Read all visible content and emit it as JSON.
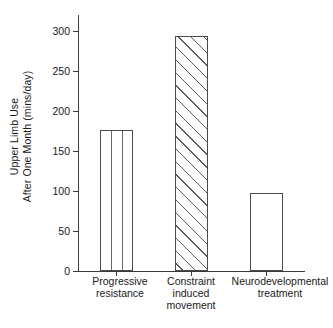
{
  "chart_data": {
    "type": "bar",
    "title": "",
    "subtitle": "",
    "xlabel": "",
    "ylabel": "Upper Limb Use After One Month (mins/day)",
    "ylabel_lines": [
      "Upper Limb Use",
      "After One Month (mins/day)"
    ],
    "categories": [
      "Progressive resistance",
      "Constraint induced movement",
      "Neurodevelopmental treatment"
    ],
    "category_lines": [
      [
        "Progressive",
        "resistance"
      ],
      [
        "Constraint",
        "induced",
        "movement"
      ],
      [
        "Neurodevelopmental",
        "treatment"
      ]
    ],
    "values": [
      176,
      294,
      97
    ],
    "ylim": [
      0,
      320
    ],
    "yticks": [
      0,
      50,
      100,
      150,
      200,
      250,
      300
    ],
    "ytick_labels": [
      "0",
      "50",
      "100",
      "150",
      "200",
      "250",
      "300"
    ],
    "grid": false,
    "legend": false,
    "legend_position": "none",
    "bar_patterns": [
      "vertical-lines",
      "diagonal-hatch",
      "plain"
    ],
    "bar_edge_color": "#4a4a4a",
    "bar_face_color": "#ffffff",
    "axis_color": "#3a3a3a",
    "background_color": "#ffffff"
  }
}
